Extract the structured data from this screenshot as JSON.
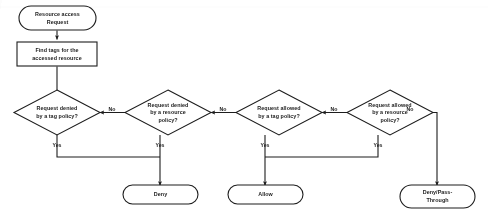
{
  "diagram": {
    "type": "flowchart",
    "colors": {
      "background": "#ffffff",
      "stroke": "#1d1d1d",
      "fill": "#ffffff",
      "text": "#1d1d1d"
    },
    "nodes": {
      "start": {
        "shape": "rounded-terminal",
        "line1": "Resource access",
        "line2": "Request"
      },
      "find_tags": {
        "shape": "rectangle",
        "line1": "Find tags for the",
        "line2": "accessed resource"
      },
      "decision_tag_deny": {
        "shape": "diamond",
        "line1": "Request denied",
        "line2": "by a tag policy?"
      },
      "decision_resource_deny": {
        "shape": "diamond",
        "line1": "Request denied",
        "line2": "by a resource",
        "line3": "policy?"
      },
      "decision_tag_allow": {
        "shape": "diamond",
        "line1": "Request allowed",
        "line2": "by a tag policy?"
      },
      "decision_resource_allow": {
        "shape": "diamond",
        "line1": "Request allowed",
        "line2": "by a resource",
        "line3": "policy?"
      },
      "deny": {
        "shape": "rounded-terminal",
        "line1": "Deny"
      },
      "allow": {
        "shape": "rounded-terminal",
        "line1": "Allow"
      },
      "deny_pass_through": {
        "shape": "rounded-terminal",
        "line1": "Deny/Pass-",
        "line2": "Through"
      }
    },
    "edge_labels": {
      "no_1": "No",
      "no_2": "No",
      "no_3": "No",
      "yes_1": "Yes",
      "yes_2": "Yes",
      "yes_3": "Yes",
      "yes_4": "Yes"
    }
  }
}
